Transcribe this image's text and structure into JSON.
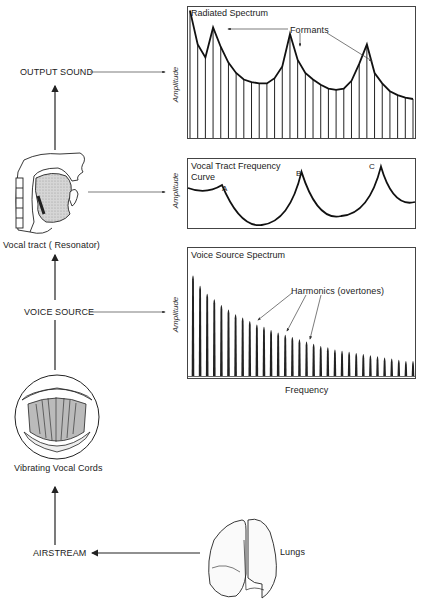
{
  "flow": {
    "output_sound": "OUTPUT SOUND",
    "vocal_tract": "Vocal tract  ( Resonator)",
    "voice_source": "VOICE SOURCE",
    "vibrating_cords": "Vibrating Vocal Cords",
    "airstream": "AIRSTREAM",
    "lungs": "Lungs"
  },
  "illustrations": {
    "head": "vocal-tract-cross-section",
    "larynx": "vocal-cords-laryngoscope-view",
    "lungs": "lungs-drawing"
  },
  "colors": {
    "ink": "#222222",
    "fill": "#c8c8c8",
    "background": "#ffffff"
  },
  "chart_data": [
    {
      "type": "bar",
      "title": "Radiated Spectrum",
      "xlabel": "",
      "ylabel": "Amplitude",
      "annotation": "Formants",
      "annotation_targets": [
        2,
        11,
        21
      ],
      "values": [
        98,
        72,
        62,
        85,
        70,
        58,
        50,
        45,
        43,
        42,
        42,
        46,
        55,
        80,
        60,
        50,
        45,
        41,
        38,
        37,
        38,
        44,
        57,
        72,
        50,
        42,
        36,
        33,
        31,
        30
      ],
      "envelope": "formant-peaks",
      "grid": false
    },
    {
      "type": "line",
      "title": "Vocal Tract Frequency Curve",
      "xlabel": "",
      "ylabel": "Amplitude",
      "peaks": [
        {
          "label": "A",
          "x": 0.15,
          "y": 0.62
        },
        {
          "label": "B",
          "x": 0.5,
          "y": 0.82
        },
        {
          "label": "C",
          "x": 0.85,
          "y": 0.9
        }
      ],
      "grid": false
    },
    {
      "type": "bar",
      "title": "Voice Source Spectrum",
      "xlabel": "Frequency",
      "ylabel": "Amplitude",
      "annotation": "Harmonics (overtones)",
      "annotation_targets": [
        8,
        13,
        16
      ],
      "values": [
        90,
        81,
        74,
        69,
        64,
        60,
        56,
        53,
        50,
        47,
        45,
        42,
        40,
        38,
        36,
        34,
        32,
        30,
        28,
        27,
        25,
        24,
        23,
        22,
        21,
        20,
        19,
        18,
        17,
        16,
        15,
        15
      ],
      "grid": false
    }
  ]
}
